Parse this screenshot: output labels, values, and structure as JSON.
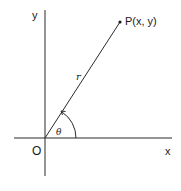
{
  "diagram": {
    "labels": {
      "y_axis": "y",
      "x_axis": "x",
      "origin": "O",
      "point": "P(x, y)",
      "radius": "r",
      "angle": "θ"
    },
    "colors": {
      "line": "#2a2a2a",
      "text": "#1a1a1a",
      "background": "#ffffff"
    }
  }
}
